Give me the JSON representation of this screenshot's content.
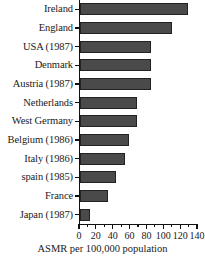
{
  "chart_data": {
    "type": "bar",
    "orientation": "horizontal",
    "title": "",
    "xlabel": "ASMR per 100,000 population",
    "ylabel": "",
    "xlim": [
      0,
      140
    ],
    "xticks": [
      0,
      20,
      40,
      60,
      80,
      100,
      120,
      140
    ],
    "xtick_labels": [
      "0",
      "20",
      "40",
      "60",
      "80",
      "100",
      "120",
      "140"
    ],
    "minor_tick_step": 10,
    "grid": false,
    "legend": false,
    "bar_color": "#4a4a4a",
    "bar_edge_color": "#222222",
    "axis_color": "#111111",
    "background": "#ffffff",
    "categories": [
      "Ireland",
      "England",
      "USA (1987)",
      "Denmark",
      "Austria (1987)",
      "Netherlands",
      "West Germany",
      "Belgium (1986)",
      "Italy (1986)",
      "spain (1985)",
      "France",
      "Japan (1987)"
    ],
    "values": [
      128,
      109,
      84,
      84,
      84,
      68,
      68,
      58,
      53,
      43,
      33,
      12
    ]
  }
}
